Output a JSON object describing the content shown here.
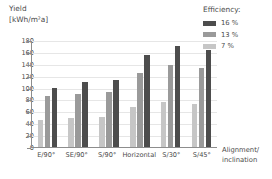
{
  "chart_data": {
    "type": "bar",
    "title": "",
    "ylabel": "Yield\n[kWh/m²a]",
    "xlabel": "Alignment/\ninclination",
    "ylim": [
      0,
      180
    ],
    "yticks": [
      0,
      20,
      40,
      60,
      80,
      100,
      120,
      140,
      160,
      180
    ],
    "grid": true,
    "legend_position": "top-right",
    "legend_title": "Efficiency:",
    "categories": [
      "E/90°",
      "SE/90°",
      "S/90°",
      "Horizontal",
      "S/30°",
      "S/45°"
    ],
    "series": [
      {
        "name": "7 %",
        "color": "#c6c6c6",
        "values": [
          45,
          48,
          50,
          68,
          75,
          72
        ]
      },
      {
        "name": "13 %",
        "color": "#9a9a9a",
        "values": [
          85,
          90,
          92,
          125,
          138,
          133
        ]
      },
      {
        "name": "16 %",
        "color": "#4d4d4d",
        "values": [
          100,
          110,
          112,
          155,
          170,
          163
        ]
      }
    ]
  },
  "legend": {
    "title": "Efficiency:",
    "items": [
      {
        "label": "16 %",
        "swatch": "s16"
      },
      {
        "label": "13 %",
        "swatch": "s13"
      },
      {
        "label": "7 %",
        "swatch": "s7"
      }
    ]
  },
  "axes": {
    "y_title": "Yield\n[kWh/m²a]",
    "x_title": "Alignment/\ninclination"
  }
}
